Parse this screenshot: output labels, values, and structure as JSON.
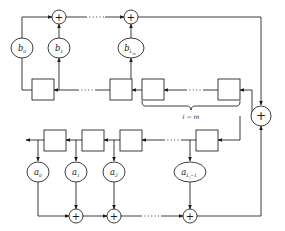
{
  "diagram": {
    "stroke_color": "#1a1a1a",
    "fill_color": "#ffffff",
    "background": "#ffffff",
    "adder_symbol": "+",
    "feedforward_coefficients": [
      {
        "id": "b0",
        "base": "b",
        "sub": "0",
        "subsub": ""
      },
      {
        "id": "b1",
        "base": "b",
        "sub": "1",
        "subsub": ""
      },
      {
        "id": "bLm",
        "base": "b",
        "sub": "L",
        "subsub": "m"
      }
    ],
    "feedback_coefficients": [
      {
        "id": "a0",
        "base": "a",
        "sub": "0",
        "subsub": "",
        "tail": ""
      },
      {
        "id": "a1",
        "base": "a",
        "sub": "1",
        "subsub": "",
        "tail": ""
      },
      {
        "id": "a2",
        "base": "a",
        "sub": "2",
        "subsub": "",
        "tail": ""
      },
      {
        "id": "aLi1",
        "base": "a",
        "sub": "L",
        "subsub": "i",
        "tail": "−1"
      }
    ],
    "brace_label": "i − m",
    "top_adders": 2,
    "bottom_adders": 3,
    "top_delay_blocks": 4,
    "bottom_delay_blocks": 4,
    "ellipsis_dots": "· · · ·"
  }
}
